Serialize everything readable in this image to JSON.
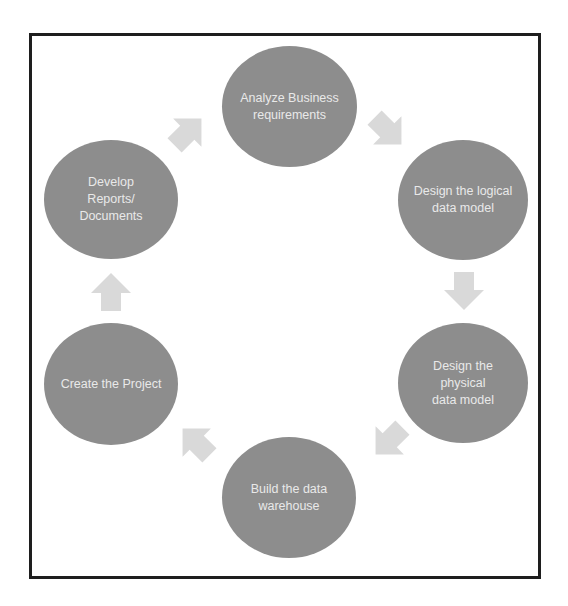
{
  "diagram": {
    "type": "cycle",
    "node_color": "#8d8d8d",
    "text_color": "#e9e9e9",
    "arrow_color": "#d9d9d9",
    "border_color": "#1e1e1e",
    "nodes": [
      {
        "id": "analyze",
        "label": "Analyze Business\nrequirements"
      },
      {
        "id": "logical",
        "label": "Design the logical\ndata model"
      },
      {
        "id": "physical",
        "label": "Design the\nphysical\ndata model"
      },
      {
        "id": "build",
        "label": "Build the data\nwarehouse"
      },
      {
        "id": "project",
        "label": "Create the Project"
      },
      {
        "id": "reports",
        "label": "Develop\nReports/\nDocuments"
      }
    ],
    "arrows": [
      {
        "from": "analyze",
        "to": "logical",
        "direction": "down-right"
      },
      {
        "from": "logical",
        "to": "physical",
        "direction": "down"
      },
      {
        "from": "physical",
        "to": "build",
        "direction": "down-left"
      },
      {
        "from": "build",
        "to": "project",
        "direction": "up-left"
      },
      {
        "from": "project",
        "to": "reports",
        "direction": "up"
      },
      {
        "from": "reports",
        "to": "analyze",
        "direction": "up-right"
      }
    ]
  }
}
